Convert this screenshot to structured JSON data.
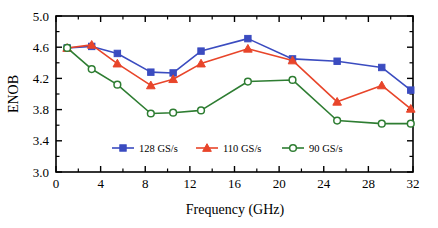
{
  "chart_data": {
    "type": "line",
    "title": "",
    "xlabel": "Frequency (GHz)",
    "ylabel": "ENOB",
    "xlim": [
      0,
      32
    ],
    "ylim": [
      3.0,
      5.0
    ],
    "xticks": [
      0,
      4,
      8,
      12,
      16,
      20,
      24,
      28,
      32
    ],
    "xtick_labels": [
      "0",
      "4",
      "8",
      "12",
      "16",
      "20",
      "24",
      "28",
      "32"
    ],
    "yticks": [
      3.0,
      3.4,
      3.8,
      4.2,
      4.6,
      5.0
    ],
    "ytick_labels": [
      "3.0",
      "3.4",
      "3.8",
      "4.2",
      "4.6",
      "5.0"
    ],
    "grid": false,
    "legend_position": "inside-bottom-center",
    "x": [
      1.0,
      3.2,
      5.5,
      8.5,
      10.5,
      13.0,
      17.2,
      21.2,
      25.2,
      29.2,
      31.8
    ],
    "series": [
      {
        "name": "128 GS/s",
        "color": "#3b4cc0",
        "marker": "square-filled",
        "values": [
          4.59,
          4.61,
          4.52,
          4.28,
          4.27,
          4.55,
          4.71,
          4.45,
          4.42,
          4.34,
          4.05
        ]
      },
      {
        "name": "110 GS/s",
        "color": "#e8452a",
        "marker": "triangle-filled",
        "values": [
          4.59,
          4.63,
          4.39,
          4.11,
          4.19,
          4.39,
          4.58,
          4.43,
          3.9,
          4.11,
          3.81
        ]
      },
      {
        "name": "90 GS/s",
        "color": "#2e7d32",
        "marker": "circle-open",
        "values": [
          4.59,
          4.32,
          4.12,
          3.75,
          3.76,
          3.79,
          4.16,
          4.18,
          3.66,
          3.62,
          3.62
        ]
      }
    ]
  },
  "legend": {
    "entries": [
      {
        "label": "128 GS/s"
      },
      {
        "label": "110 GS/s"
      },
      {
        "label": "90 GS/s"
      }
    ]
  },
  "colors": {
    "series_128": "#3b4cc0",
    "series_110": "#e8452a",
    "series_90": "#2e7d32",
    "axis": "#000000",
    "background": "#ffffff"
  }
}
